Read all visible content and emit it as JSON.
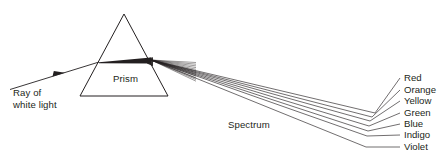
{
  "diagram": {
    "background_color": "#ffffff",
    "ink_color": "#231f20",
    "labels": {
      "ray_line1": "Ray of",
      "ray_line2": "white light",
      "prism": "Prism",
      "spectrum": "Spectrum"
    },
    "spectrum_colors": [
      {
        "name": "Red"
      },
      {
        "name": "Orange"
      },
      {
        "name": "Yellow"
      },
      {
        "name": "Green"
      },
      {
        "name": "Blue"
      },
      {
        "name": "Indigo"
      },
      {
        "name": "Violet"
      }
    ]
  },
  "chart_data": {
    "type": "diagram",
    "elements": {
      "prism": {
        "shape": "triangle",
        "apex": [
          124,
          14
        ],
        "bottom_left": [
          80,
          96
        ],
        "bottom_right": [
          168,
          96
        ]
      },
      "incident_ray": {
        "from": [
          10,
          89
        ],
        "to": [
          99,
          62
        ],
        "arrow_at": [
          60,
          74
        ],
        "label": "Ray of white light"
      },
      "internal_beam": {
        "entry": [
          99,
          62
        ],
        "exit": [
          151,
          60
        ],
        "description": "thick white-light beam widening toward exit face"
      },
      "dispersion_origin": [
        151,
        60
      ],
      "spectrum_rays": [
        {
          "color": "Red",
          "bend": [
            375,
            113
          ],
          "label_line_end": [
            400,
            78
          ],
          "label_x": 404,
          "label_y": 81
        },
        {
          "color": "Orange",
          "bend": [
            372,
            117
          ],
          "label_line_end": [
            400,
            90
          ],
          "label_x": 404,
          "label_y": 93
        },
        {
          "color": "Yellow",
          "bend": [
            370,
            121
          ],
          "label_line_end": [
            400,
            101
          ],
          "label_x": 404,
          "label_y": 104
        },
        {
          "color": "Green",
          "bend": [
            369,
            126
          ],
          "label_line_end": [
            400,
            113
          ],
          "label_x": 404,
          "label_y": 116
        },
        {
          "color": "Blue",
          "bend": [
            368,
            131
          ],
          "label_line_end": [
            400,
            124
          ],
          "label_x": 404,
          "label_y": 127
        },
        {
          "color": "Indigo",
          "bend": [
            367,
            136
          ],
          "label_line_end": [
            400,
            135
          ],
          "label_x": 404,
          "label_y": 138
        },
        {
          "color": "Violet",
          "bend": [
            366,
            147
          ],
          "label_line_end": [
            400,
            147
          ],
          "label_x": 404,
          "label_y": 150
        }
      ],
      "spectrum_label": {
        "text": "Spectrum",
        "x": 228,
        "y": 128
      },
      "prism_label": {
        "text": "Prism",
        "x": 113,
        "y": 82
      }
    }
  }
}
